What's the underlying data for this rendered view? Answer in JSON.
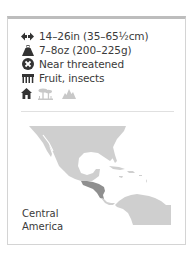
{
  "facts": {
    "length": {
      "icon": "length-arrows-icon",
      "text": "14–26in (35–65½cm)"
    },
    "weight": {
      "icon": "weight-icon",
      "text": "7–8oz (200–225g)"
    },
    "status": {
      "icon": "conservation-status-icon",
      "text": "Near threatened"
    },
    "diet": {
      "icon": "diet-icon",
      "text": "Fruit, insects"
    }
  },
  "habitat": {
    "icons": [
      {
        "name": "house-icon",
        "active": true
      },
      {
        "name": "tree-savanna-icon",
        "active": false
      },
      {
        "name": "mountain-icon",
        "active": false
      }
    ]
  },
  "map": {
    "region_label_line1": "Central",
    "region_label_line2": "America",
    "colors": {
      "land": "#cfcfcf",
      "range": "#8f8f8f",
      "water": "#ffffff"
    }
  },
  "colors": {
    "text": "#3a3a3a",
    "icon_active": "#333333",
    "icon_inactive": "#c8c8c8",
    "card_top_border": "#bdbdbd",
    "card_border": "#d4d4d4"
  }
}
